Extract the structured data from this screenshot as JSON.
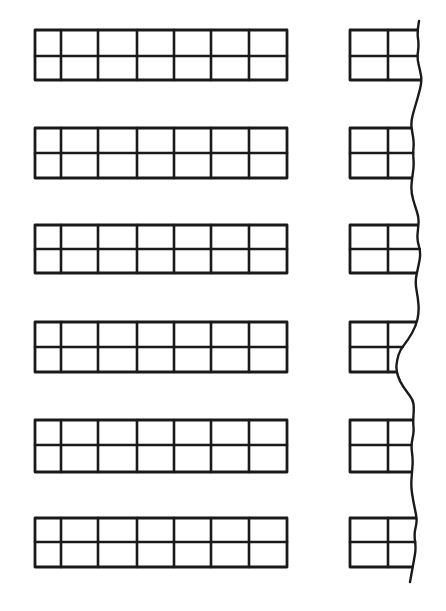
{
  "diagram": {
    "type": "repeating-grid-blocks-with-break-line",
    "ink_color": "#1a1a1a",
    "background": "#ffffff",
    "left_blocks": {
      "count": 6,
      "columns": 7,
      "rows": 2,
      "column_edges_x": [
        35,
        61,
        98,
        137,
        174,
        211,
        249,
        287
      ],
      "blocks": [
        {
          "top": 30,
          "mid": 56,
          "bottom": 80
        },
        {
          "top": 128,
          "mid": 153,
          "bottom": 178
        },
        {
          "top": 225,
          "mid": 249,
          "bottom": 273
        },
        {
          "top": 322,
          "mid": 347,
          "bottom": 372
        },
        {
          "top": 420,
          "mid": 445,
          "bottom": 472
        },
        {
          "top": 518,
          "mid": 542,
          "bottom": 567
        }
      ]
    },
    "right_blocks": {
      "count": 6,
      "columns": 2,
      "rows": 2,
      "left_x": 350,
      "mid_x": 388,
      "truncated_by": "wavy-break-line"
    },
    "break_line": {
      "description": "vertical wavy line indicating continuation/cut",
      "points": [
        [
          419,
          21
        ],
        [
          417,
          32
        ],
        [
          419,
          45
        ],
        [
          417,
          58
        ],
        [
          420,
          70
        ],
        [
          422,
          81
        ],
        [
          418,
          97
        ],
        [
          414,
          110
        ],
        [
          411,
          122
        ],
        [
          412,
          131
        ],
        [
          414,
          142
        ],
        [
          413,
          153
        ],
        [
          414,
          166
        ],
        [
          412,
          178
        ],
        [
          411,
          192
        ],
        [
          415,
          206
        ],
        [
          419,
          218
        ],
        [
          418,
          229
        ],
        [
          417,
          240
        ],
        [
          421,
          253
        ],
        [
          418,
          268
        ],
        [
          415,
          282
        ],
        [
          418,
          298
        ],
        [
          419,
          312
        ],
        [
          416,
          326
        ],
        [
          408,
          340
        ],
        [
          400,
          350
        ],
        [
          397,
          360
        ],
        [
          396,
          370
        ],
        [
          400,
          382
        ],
        [
          407,
          392
        ],
        [
          413,
          400
        ],
        [
          414,
          408
        ],
        [
          413,
          422
        ],
        [
          414,
          432
        ],
        [
          411,
          445
        ],
        [
          413,
          460
        ],
        [
          412,
          472
        ],
        [
          411,
          486
        ],
        [
          413,
          500
        ],
        [
          416,
          514
        ],
        [
          417,
          522
        ],
        [
          414,
          534
        ],
        [
          416,
          548
        ],
        [
          414,
          560
        ],
        [
          410,
          582
        ]
      ]
    }
  }
}
